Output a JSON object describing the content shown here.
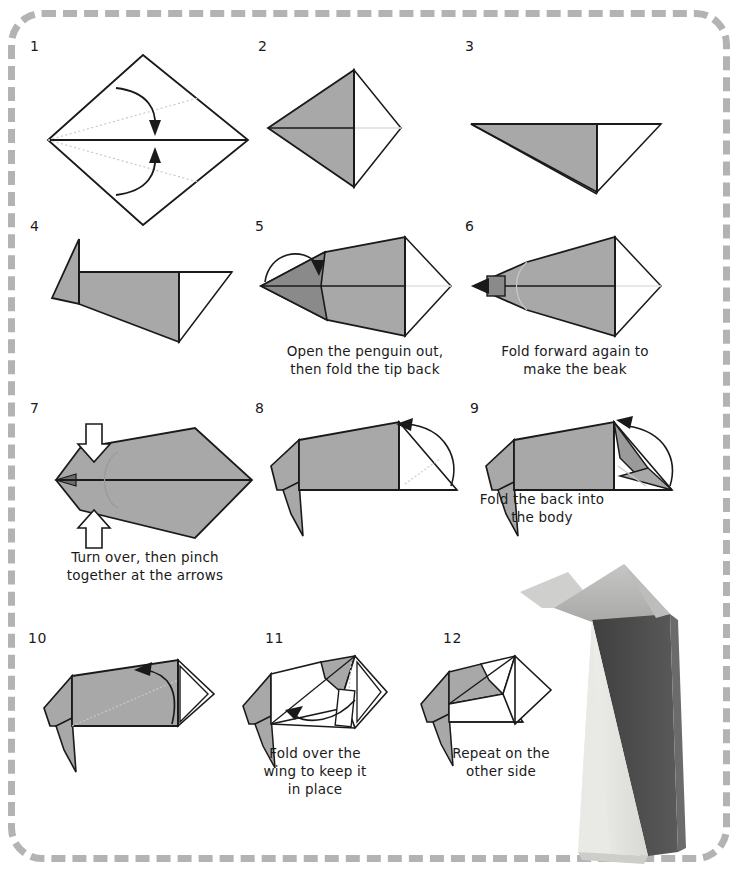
{
  "document": {
    "title": "Origami Penguin Instructions",
    "kind": "origami-diagram-sheet",
    "border_style": "dashed-rounded-rectangle",
    "border_color": "#b3b3b3"
  },
  "colors": {
    "paper_gray": "#a8a8a8",
    "paper_gray_dark": "#8a8a8a",
    "paper_white": "#ffffff",
    "line": "#1a1a1a",
    "crease": "#b9b9b9",
    "background": "#ffffff",
    "photo_head": "#b4b4b4",
    "photo_back_dark": "#4d4d4d",
    "photo_belly": "#e4e4e0"
  },
  "steps": [
    {
      "number": "1",
      "caption": ""
    },
    {
      "number": "2",
      "caption": ""
    },
    {
      "number": "3",
      "caption": ""
    },
    {
      "number": "4",
      "caption": ""
    },
    {
      "number": "5",
      "caption": "Open the penguin out,\nthen fold the tip back"
    },
    {
      "number": "6",
      "caption": "Fold forward again to\nmake the beak"
    },
    {
      "number": "7",
      "caption": "Turn over, then pinch\ntogether at the arrows"
    },
    {
      "number": "8",
      "caption": ""
    },
    {
      "number": "9",
      "caption": "Fold the back into\nthe body"
    },
    {
      "number": "10",
      "caption": ""
    },
    {
      "number": "11",
      "caption": "Fold over the\nwing to keep it\nin place"
    },
    {
      "number": "12",
      "caption": "Repeat on the\nother side"
    }
  ],
  "photo": {
    "subject": "finished-origami-penguin",
    "description": "Completed folded paper penguin standing upright"
  }
}
